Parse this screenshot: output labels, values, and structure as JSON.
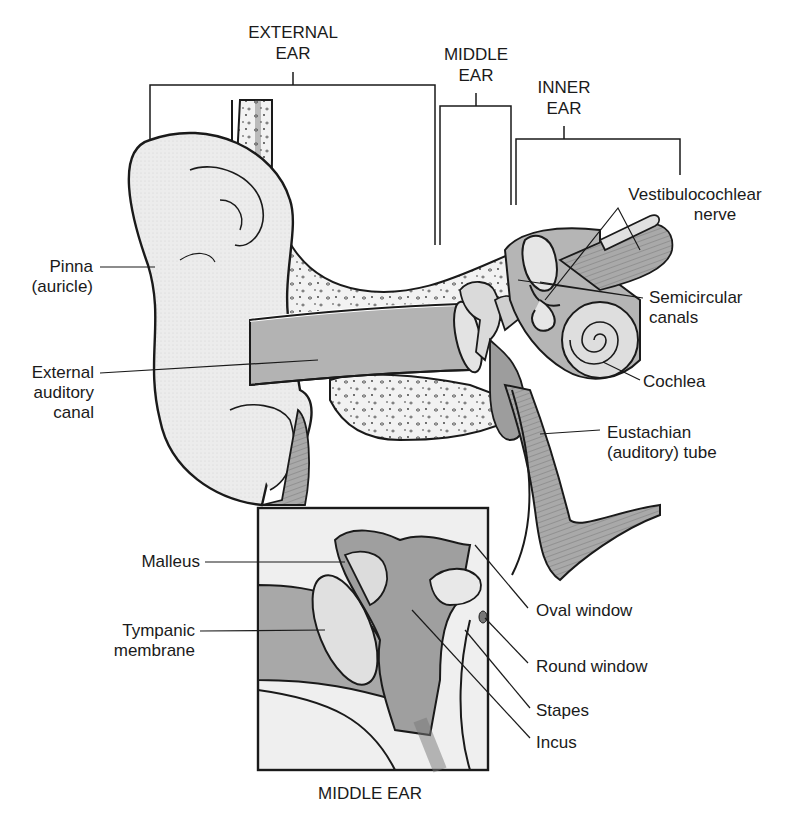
{
  "regions": {
    "external_ear": [
      "EXTERNAL",
      "EAR"
    ],
    "middle_ear": [
      "MIDDLE",
      "EAR"
    ],
    "inner_ear": [
      "INNER",
      "EAR"
    ]
  },
  "labels": {
    "pinna": [
      "Pinna",
      "(auricle)"
    ],
    "external_auditory_canal": [
      "External",
      "auditory",
      "canal"
    ],
    "vestibulocochlear_nerve": [
      "Vestibulocochlear",
      "nerve"
    ],
    "semicircular_canals": [
      "Semicircular",
      "canals"
    ],
    "cochlea": "Cochlea",
    "eustachian_tube": [
      "Eustachian",
      "(auditory) tube"
    ],
    "malleus": "Malleus",
    "tympanic_membrane": [
      "Tympanic",
      "membrane"
    ],
    "oval_window": "Oval window",
    "round_window": "Round window",
    "stapes": "Stapes",
    "incus": "Incus"
  },
  "inset": {
    "caption": "MIDDLE EAR"
  },
  "colors": {
    "line": "#1a1a1a",
    "tissue_light": "#e9e9e9",
    "tissue_mid": "#cfcfcf",
    "tissue_dark": "#9a9a9a",
    "bone_speckle": "#444444",
    "background": "#ffffff"
  }
}
